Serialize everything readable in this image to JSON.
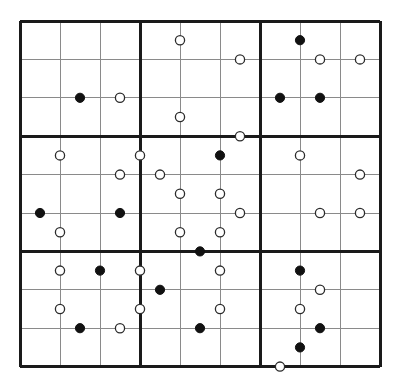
{
  "puzzle": {
    "type": "kropki-sudoku-grid",
    "title": "Kropki Sudoku Grid",
    "size": 9,
    "box_size": 3,
    "geometry": {
      "x0": 20,
      "y0": 21,
      "cell_w": 40,
      "cell_h": 38.4,
      "thin_line_color": "#8a8a8a",
      "thick_line_color": "#1a1a1a",
      "thin_line_width": 1,
      "thick_line_width": 3,
      "dot_radius": 4.6,
      "dot_black_fill": "#111111",
      "dot_white_fill": "#ffffff",
      "dot_stroke": "#2b2b2b",
      "background": "#ffffff"
    },
    "legend": {
      "black_dot": "ratio-2-constraint",
      "white_dot": "consecutive-constraint"
    },
    "dots": [
      {
        "orientation": "h",
        "row": 3,
        "col": 2,
        "color": "black"
      },
      {
        "orientation": "h",
        "row": 3,
        "col": 3,
        "color": "white"
      },
      {
        "orientation": "v",
        "row": 1,
        "col": 5,
        "color": "white"
      },
      {
        "orientation": "v",
        "row": 3,
        "col": 5,
        "color": "white"
      },
      {
        "orientation": "h",
        "row": 2,
        "col": 6,
        "color": "white"
      },
      {
        "orientation": "v",
        "row": 4,
        "col": 4,
        "color": "white"
      },
      {
        "orientation": "h",
        "row": 4,
        "col": 6,
        "color": "white"
      },
      {
        "orientation": "v",
        "row": 1,
        "col": 8,
        "color": "black"
      },
      {
        "orientation": "h",
        "row": 2,
        "col": 8,
        "color": "white"
      },
      {
        "orientation": "h",
        "row": 2,
        "col": 9,
        "color": "white"
      },
      {
        "orientation": "h",
        "row": 3,
        "col": 8,
        "color": "black"
      },
      {
        "orientation": "h",
        "row": 3,
        "col": 7,
        "color": "black"
      },
      {
        "orientation": "v",
        "row": 4,
        "col": 2,
        "color": "white"
      },
      {
        "orientation": "h",
        "row": 5,
        "col": 3,
        "color": "white"
      },
      {
        "orientation": "h",
        "row": 5,
        "col": 4,
        "color": "white"
      },
      {
        "orientation": "h",
        "row": 6,
        "col": 1,
        "color": "black"
      },
      {
        "orientation": "h",
        "row": 6,
        "col": 3,
        "color": "black"
      },
      {
        "orientation": "v",
        "row": 6,
        "col": 2,
        "color": "white"
      },
      {
        "orientation": "v",
        "row": 4,
        "col": 6,
        "color": "black"
      },
      {
        "orientation": "v",
        "row": 5,
        "col": 5,
        "color": "white"
      },
      {
        "orientation": "v",
        "row": 5,
        "col": 6,
        "color": "white"
      },
      {
        "orientation": "v",
        "row": 6,
        "col": 5,
        "color": "white"
      },
      {
        "orientation": "v",
        "row": 6,
        "col": 6,
        "color": "white"
      },
      {
        "orientation": "h",
        "row": 6,
        "col": 6,
        "color": "white"
      },
      {
        "orientation": "h",
        "row": 7,
        "col": 5,
        "color": "black"
      },
      {
        "orientation": "v",
        "row": 4,
        "col": 8,
        "color": "white"
      },
      {
        "orientation": "h",
        "row": 5,
        "col": 9,
        "color": "white"
      },
      {
        "orientation": "h",
        "row": 6,
        "col": 8,
        "color": "white"
      },
      {
        "orientation": "h",
        "row": 6,
        "col": 9,
        "color": "white"
      },
      {
        "orientation": "v",
        "row": 7,
        "col": 2,
        "color": "white"
      },
      {
        "orientation": "v",
        "row": 7,
        "col": 3,
        "color": "black"
      },
      {
        "orientation": "h",
        "row": 8,
        "col": 4,
        "color": "black"
      },
      {
        "orientation": "v",
        "row": 8,
        "col": 2,
        "color": "white"
      },
      {
        "orientation": "h",
        "row": 9,
        "col": 2,
        "color": "black"
      },
      {
        "orientation": "h",
        "row": 9,
        "col": 3,
        "color": "white"
      },
      {
        "orientation": "v",
        "row": 7,
        "col": 4,
        "color": "white"
      },
      {
        "orientation": "v",
        "row": 8,
        "col": 4,
        "color": "white"
      },
      {
        "orientation": "v",
        "row": 7,
        "col": 6,
        "color": "white"
      },
      {
        "orientation": "v",
        "row": 8,
        "col": 6,
        "color": "white"
      },
      {
        "orientation": "h",
        "row": 9,
        "col": 5,
        "color": "black"
      },
      {
        "orientation": "v",
        "row": 7,
        "col": 8,
        "color": "black"
      },
      {
        "orientation": "h",
        "row": 8,
        "col": 8,
        "color": "white"
      },
      {
        "orientation": "v",
        "row": 8,
        "col": 8,
        "color": "white"
      },
      {
        "orientation": "h",
        "row": 9,
        "col": 8,
        "color": "black"
      },
      {
        "orientation": "v",
        "row": 9,
        "col": 8,
        "color": "black"
      },
      {
        "orientation": "h",
        "row": 10,
        "col": 7,
        "color": "white"
      }
    ]
  }
}
